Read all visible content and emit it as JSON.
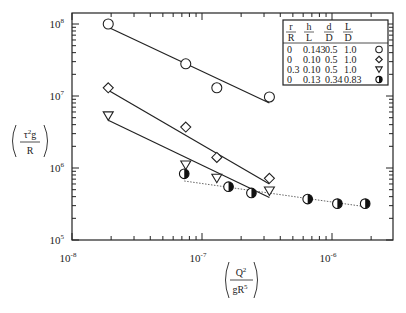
{
  "chart_data": {
    "type": "scatter",
    "title": "",
    "xlabel": "(Q^2 / gR^5)",
    "ylabel": "(τ^2 g / R)",
    "xscale": "log",
    "yscale": "log",
    "xlim": [
      1e-08,
      3e-06
    ],
    "ylim": [
      100000.0,
      120000000.0
    ],
    "x_ticks": [
      {
        "base": "10",
        "exp": "-8",
        "value": 1e-08
      },
      {
        "base": "10",
        "exp": "-7",
        "value": 1e-07
      },
      {
        "base": "10",
        "exp": "-6",
        "value": 1e-06
      }
    ],
    "y_ticks": [
      {
        "base": "10",
        "exp": "5",
        "value": 100000.0
      },
      {
        "base": "10",
        "exp": "6",
        "value": 1000000.0
      },
      {
        "base": "10",
        "exp": "7",
        "value": 10000000.0
      },
      {
        "base": "10",
        "exp": "8",
        "value": 100000000.0
      }
    ],
    "grid": false,
    "legend_position": "upper right",
    "legend": {
      "headers": [
        {
          "num": "r",
          "den": "R"
        },
        {
          "num": "h",
          "den": "L"
        },
        {
          "num": "d",
          "den": "D"
        },
        {
          "num": "L",
          "den": "D"
        }
      ],
      "rows": [
        {
          "values": [
            "0",
            "0.143",
            "0.5",
            "1.0"
          ],
          "marker": "circle-open"
        },
        {
          "values": [
            "0",
            "0.10",
            "0.5",
            "1.0"
          ],
          "marker": "diamond-open"
        },
        {
          "values": [
            "0.3",
            "0.10",
            "0.5",
            "1.0"
          ],
          "marker": "triangle-down-open"
        },
        {
          "values": [
            "0",
            "0.13",
            "0.34",
            "0.83"
          ],
          "marker": "circle-half-filled"
        }
      ]
    },
    "series": [
      {
        "name": "r/R=0, h/L=0.143, d/D=0.5, L/D=1.0",
        "marker": "circle-open",
        "fit_line": "solid",
        "x": [
          1.9e-08,
          7.5e-08,
          1.3e-07,
          3.3e-07
        ],
        "y": [
          100000000.0,
          28000000.0,
          13000000.0,
          9700000.0
        ],
        "line": {
          "x": [
            1.9e-08,
            3.3e-07
          ],
          "y": [
            90000000.0,
            8000000.0
          ]
        }
      },
      {
        "name": "r/R=0, h/L=0.10, d/D=0.5, L/D=1.0",
        "marker": "diamond-open",
        "fit_line": "solid",
        "x": [
          1.9e-08,
          7.5e-08,
          1.3e-07,
          3.3e-07
        ],
        "y": [
          13000000.0,
          3700000.0,
          1400000.0,
          720000.0
        ],
        "line": {
          "x": [
            1.9e-08,
            3.3e-07
          ],
          "y": [
            12000000.0,
            600000.0
          ]
        }
      },
      {
        "name": "r/R=0.3, h/L=0.10, d/D=0.5, L/D=1.0",
        "marker": "triangle-down-open",
        "fit_line": "solid",
        "x": [
          1.9e-08,
          7.5e-08,
          1.3e-07,
          3.3e-07
        ],
        "y": [
          5300000.0,
          1100000.0,
          720000.0,
          480000.0
        ],
        "line": {
          "x": [
            1.9e-08,
            3.3e-07
          ],
          "y": [
            4600000.0,
            390000.0
          ]
        }
      },
      {
        "name": "r/R=0, h/L=0.13, d/D=0.34, L/D=0.83",
        "marker": "circle-half-filled",
        "fit_line": "dotted",
        "x": [
          7.3e-08,
          1.6e-07,
          2.4e-07,
          6.5e-07,
          1.1e-06,
          1.8e-06
        ],
        "y": [
          830000.0,
          550000.0,
          450000.0,
          370000.0,
          320000.0,
          320000.0
        ],
        "line": {
          "x": [
            7.3e-08,
            1.8e-06
          ],
          "y": [
            660000.0,
            290000.0
          ]
        }
      }
    ],
    "axis_label_x": {
      "num": "Q",
      "num_sup": "2",
      "den": "gR",
      "den_sup": "5"
    },
    "axis_label_y": {
      "num": "τ",
      "num_sup": "2",
      "num_after": "g",
      "den": "R"
    }
  }
}
